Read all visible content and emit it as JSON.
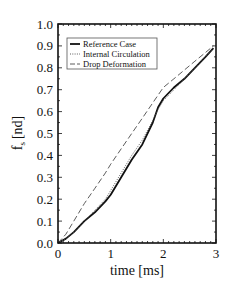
{
  "chart_data": {
    "type": "line",
    "title": "",
    "xlabel": "time [ms]",
    "ylabel": "f_s [nd]",
    "ylabel_main": "f",
    "ylabel_sub": "s",
    "ylabel_unit": "[nd]",
    "xlim": [
      0,
      3
    ],
    "ylim": [
      0,
      1.0
    ],
    "x_ticks": [
      "0",
      "1",
      "2",
      "3"
    ],
    "y_ticks": [
      "0.0",
      "0.1",
      "0.2",
      "0.3",
      "0.4",
      "0.5",
      "0.6",
      "0.7",
      "0.8",
      "0.9",
      "1.0"
    ],
    "grid": false,
    "legend_position": "upper left",
    "series": [
      {
        "name": "Reference Case",
        "style": "solid-thick",
        "x": [
          0,
          0.15,
          0.3,
          0.5,
          0.7,
          0.9,
          1.0,
          1.2,
          1.4,
          1.6,
          1.8,
          1.9,
          2.0,
          2.2,
          2.4,
          2.6,
          2.8,
          2.95
        ],
        "y": [
          0,
          0.02,
          0.05,
          0.1,
          0.14,
          0.19,
          0.22,
          0.3,
          0.38,
          0.45,
          0.55,
          0.62,
          0.66,
          0.71,
          0.75,
          0.8,
          0.85,
          0.89
        ]
      },
      {
        "name": "Internal Circulation",
        "style": "dotted",
        "x": [
          0,
          0.15,
          0.3,
          0.5,
          0.7,
          0.9,
          1.0,
          1.2,
          1.4,
          1.6,
          1.8,
          1.9,
          2.0,
          2.2,
          2.4,
          2.6,
          2.8,
          2.95
        ],
        "y": [
          0,
          0.02,
          0.05,
          0.1,
          0.15,
          0.2,
          0.24,
          0.32,
          0.4,
          0.47,
          0.56,
          0.61,
          0.65,
          0.7,
          0.75,
          0.8,
          0.85,
          0.89
        ]
      },
      {
        "name": "Drop Deformation",
        "style": "dashed",
        "x": [
          0,
          0.15,
          0.3,
          0.5,
          0.7,
          0.9,
          1.0,
          1.2,
          1.4,
          1.6,
          1.8,
          2.0,
          2.2,
          2.4,
          2.6,
          2.8,
          2.95
        ],
        "y": [
          0,
          0.04,
          0.1,
          0.18,
          0.25,
          0.32,
          0.36,
          0.43,
          0.5,
          0.57,
          0.64,
          0.71,
          0.75,
          0.79,
          0.83,
          0.87,
          0.9
        ]
      }
    ]
  }
}
